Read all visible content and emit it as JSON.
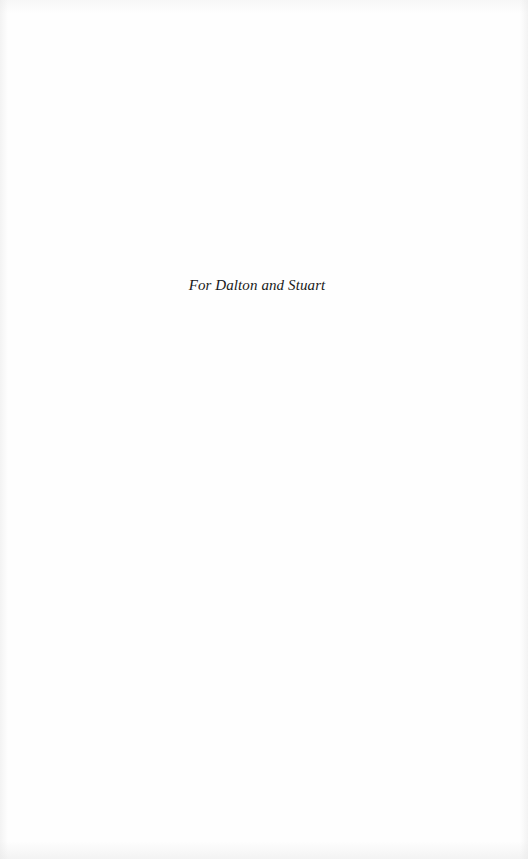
{
  "page": {
    "type": "dedication",
    "dedication_text": "For Dalton and Stuart"
  },
  "colors": {
    "background": "#fefefe",
    "text": "#1a1a1a"
  }
}
